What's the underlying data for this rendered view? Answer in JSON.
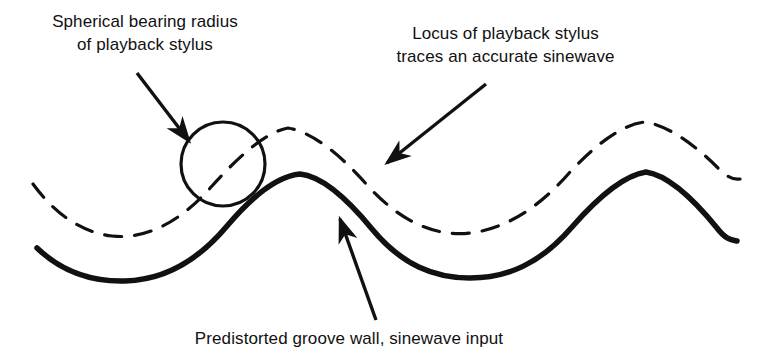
{
  "diagram": {
    "background_color": "#ffffff",
    "ink_color": "#111111",
    "width": 764,
    "height": 356,
    "labels": {
      "stylus_radius": {
        "line1": "Spherical bearing radius",
        "line2": "of playback stylus"
      },
      "stylus_locus": {
        "line1": "Locus of playback stylus",
        "line2": "traces an accurate sinewave"
      },
      "groove_wall": {
        "line1": "Predistorted groove wall, sinewave input"
      }
    },
    "elements": {
      "solid_curve_name": "predistorted-groove-wall-curve",
      "dashed_curve_name": "playback-stylus-locus-curve",
      "circle_name": "stylus-bearing-circle"
    }
  },
  "chart_data": {
    "type": "line",
    "title": "Predistorted groove wall, sinewave input",
    "xlabel": "",
    "ylabel": "",
    "grid": false,
    "legend": "none",
    "xlim": [
      0,
      764
    ],
    "ylim": [
      356,
      0
    ],
    "annotations": [
      {
        "name": "stylus-radius-annotation",
        "text": "Spherical bearing radius of playback stylus",
        "arrow_from": [
          137,
          73
        ],
        "arrow_to": [
          189,
          141
        ]
      },
      {
        "name": "stylus-locus-annotation",
        "text": "Locus of playback stylus traces an accurate sinewave",
        "arrow_from": [
          486,
          84
        ],
        "arrow_to": [
          387,
          163
        ]
      },
      {
        "name": "groove-wall-annotation",
        "text": "Predistorted groove wall, sinewave input",
        "arrow_from": [
          376,
          320
        ],
        "arrow_to": [
          340,
          219
        ]
      }
    ],
    "shapes": [
      {
        "name": "stylus-bearing-circle",
        "type": "circle",
        "cx": 223,
        "cy": 164,
        "r": 42,
        "stroke": "#111111",
        "stroke_width": 3.2,
        "fill": "none"
      }
    ],
    "series": [
      {
        "name": "predistorted-groove-wall-curve",
        "style": "solid",
        "stroke": "#111111",
        "stroke_width": 5.5,
        "comment": "Sharp peaked crests, broad rounded troughs",
        "path": "M 37,248 C 60,270 88,282 125,281 C 163,280 196,263 227,226 C 254,194 279,176 300,174 C 320,176 345,196 372,229 C 402,265 434,278 470,278 C 507,278 540,264 572,227 C 600,195 626,175 646,172 C 666,175 691,196 717,228 C 726,240 732,240 737,241"
      },
      {
        "name": "playback-stylus-locus-curve",
        "style": "dashed",
        "stroke": "#111111",
        "stroke_width": 3.2,
        "dash_array": "17 13",
        "comment": "Smooth accurate sinewave traced by stylus centre",
        "path": "M 33,184 C 52,210 78,232 112,236 C 148,240 182,220 212,186 C 240,155 266,132 288,128 C 312,132 340,154 368,186 C 400,221 434,237 470,233 C 505,229 539,208 570,172 C 600,140 625,124 645,122 C 666,125 692,142 718,168 C 728,178 734,180 740,179"
      }
    ]
  }
}
